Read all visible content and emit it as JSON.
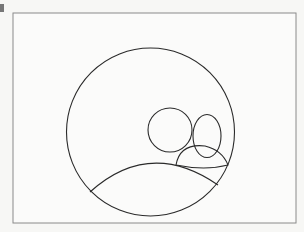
{
  "figure": {
    "stroke_color": "#2a2a2a",
    "frame_color": "#888888",
    "background": "#f7f7f5"
  }
}
